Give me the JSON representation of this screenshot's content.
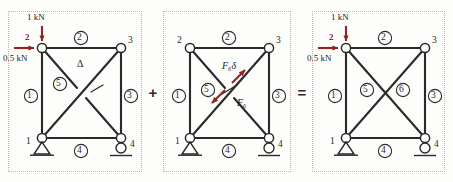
{
  "figure": {
    "background_color": "#fdfdfc",
    "member_color": "#2a2a2a",
    "load_color": "#8d2622",
    "panel_border_color": "#b9b6b0"
  },
  "operators": {
    "plus": "+",
    "equals": "="
  },
  "panels": [
    {
      "id": "panel-primary-structure",
      "caption": "primary structure with applied loads",
      "nodes": [
        {
          "id": "n1",
          "label": "1",
          "support": "pin"
        },
        {
          "id": "n2",
          "label": "2",
          "support": "none"
        },
        {
          "id": "n3",
          "label": "3",
          "support": "none"
        },
        {
          "id": "n4",
          "label": "4",
          "support": "roller"
        }
      ],
      "members": [
        {
          "id": "m1",
          "label": "1",
          "from": "n1",
          "to": "n2"
        },
        {
          "id": "m2",
          "label": "2",
          "from": "n2",
          "to": "n3"
        },
        {
          "id": "m3",
          "label": "3",
          "from": "n3",
          "to": "n4"
        },
        {
          "id": "m4",
          "label": "4",
          "from": "n1",
          "to": "n4"
        },
        {
          "id": "m5",
          "label": "5",
          "from": "n1",
          "to": "n3"
        },
        {
          "id": "m6",
          "label": "",
          "from": "n2",
          "to": "n4"
        }
      ],
      "loads": [
        {
          "id": "vertical-load",
          "magnitude": "1 kN",
          "direction": "down",
          "at_node": "2"
        },
        {
          "id": "horizontal-load",
          "magnitude": "0.5 kN",
          "direction": "right",
          "at_node": "2"
        }
      ],
      "node_marker_label": "2",
      "gap_annotation": {
        "symbol": "Δ",
        "note": "gap in removed redundant member"
      }
    },
    {
      "id": "panel-redundant-force",
      "caption": "redundant member force self-equilibrating pair",
      "nodes": [
        {
          "id": "n1",
          "label": "1",
          "support": "pin"
        },
        {
          "id": "n2",
          "label": "2",
          "support": "none"
        },
        {
          "id": "n3",
          "label": "3",
          "support": "none"
        },
        {
          "id": "n4",
          "label": "4",
          "support": "roller"
        }
      ],
      "members": [
        {
          "id": "m1",
          "label": "1",
          "from": "n1",
          "to": "n2"
        },
        {
          "id": "m2",
          "label": "2",
          "from": "n2",
          "to": "n3"
        },
        {
          "id": "m3",
          "label": "3",
          "from": "n3",
          "to": "n4"
        },
        {
          "id": "m4",
          "label": "4",
          "from": "n1",
          "to": "n4"
        },
        {
          "id": "m5",
          "label": "5",
          "from": "n1",
          "to": "n3"
        },
        {
          "id": "m6",
          "label": "",
          "from": "n2",
          "to": "n4"
        }
      ],
      "loads": [],
      "force_labels": [
        {
          "id": "f6-delta",
          "text": "F₆δ"
        },
        {
          "id": "f6",
          "text": "F₆"
        }
      ]
    },
    {
      "id": "panel-combined-structure",
      "caption": "combined indeterminate truss",
      "nodes": [
        {
          "id": "n1",
          "label": "1",
          "support": "pin"
        },
        {
          "id": "n2",
          "label": "2",
          "support": "none"
        },
        {
          "id": "n3",
          "label": "3",
          "support": "none"
        },
        {
          "id": "n4",
          "label": "4",
          "support": "roller"
        }
      ],
      "members": [
        {
          "id": "m1",
          "label": "1",
          "from": "n1",
          "to": "n2"
        },
        {
          "id": "m2",
          "label": "2",
          "from": "n2",
          "to": "n3"
        },
        {
          "id": "m3",
          "label": "3",
          "from": "n3",
          "to": "n4"
        },
        {
          "id": "m4",
          "label": "4",
          "from": "n1",
          "to": "n4"
        },
        {
          "id": "m5",
          "label": "5",
          "from": "n1",
          "to": "n3"
        },
        {
          "id": "m6",
          "label": "6",
          "from": "n2",
          "to": "n4"
        }
      ],
      "loads": [
        {
          "id": "vertical-load",
          "magnitude": "1 kN",
          "direction": "down",
          "at_node": "2"
        },
        {
          "id": "horizontal-load",
          "magnitude": "0.5 kN",
          "direction": "right",
          "at_node": "2"
        }
      ],
      "node_marker_label": "2"
    }
  ]
}
